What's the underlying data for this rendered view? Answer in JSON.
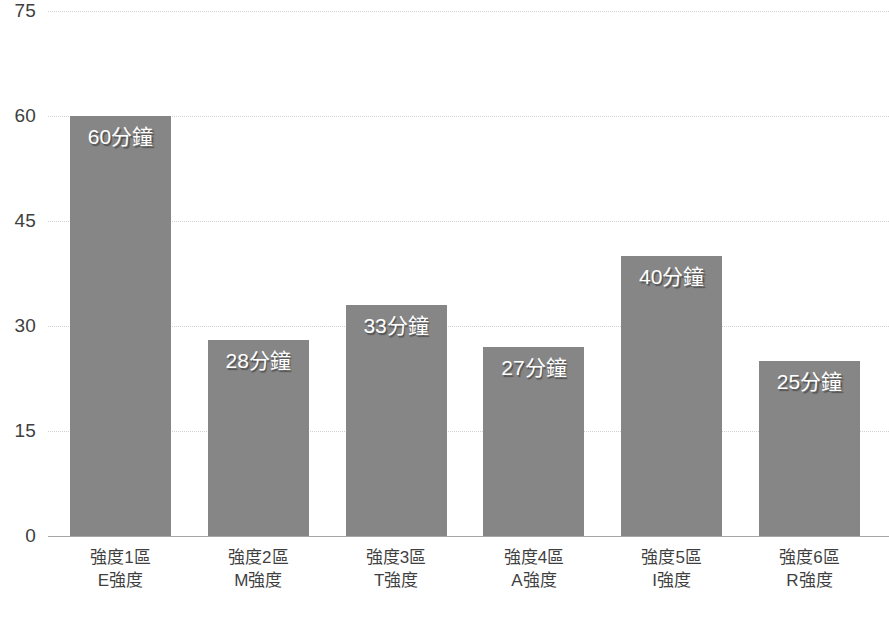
{
  "chart_data": {
    "type": "bar",
    "title": "",
    "xlabel": "",
    "ylabel": "",
    "ylim": [
      0,
      75
    ],
    "grid": true,
    "legend": "none",
    "categories": [
      "強度1區\nE強度",
      "強度2區\nM強度",
      "強度3區\nT強度",
      "強度4區\nA強度",
      "強度5區\nI強度",
      "強度6區\nR強度"
    ],
    "values": [
      60,
      28,
      33,
      27,
      40,
      25
    ],
    "data_labels": [
      "60分鐘",
      "28分鐘",
      "33分鐘",
      "27分鐘",
      "40分鐘",
      "25分鐘"
    ],
    "yticks": [
      0,
      15,
      30,
      45,
      60,
      75
    ],
    "ytick_labels": [
      "0",
      "15",
      "30",
      "45",
      "60",
      "75"
    ],
    "bar_color": "#868686",
    "gridline_color": "#d2d2d2",
    "label_text_color": "#ffffff"
  },
  "axis": {
    "ticks": [
      {
        "label": "75",
        "value": 75
      },
      {
        "label": "60",
        "value": 60
      },
      {
        "label": "45",
        "value": 45
      },
      {
        "label": "30",
        "value": 30
      },
      {
        "label": "15",
        "value": 15
      },
      {
        "label": "0",
        "value": 0
      }
    ]
  },
  "bars": [
    {
      "value": 60,
      "data_label": "60分鐘",
      "cat_line1": "強度1區",
      "cat_line2": "E強度"
    },
    {
      "value": 28,
      "data_label": "28分鐘",
      "cat_line1": "強度2區",
      "cat_line2": "M強度"
    },
    {
      "value": 33,
      "data_label": "33分鐘",
      "cat_line1": "強度3區",
      "cat_line2": "T強度"
    },
    {
      "value": 27,
      "data_label": "27分鐘",
      "cat_line1": "強度4區",
      "cat_line2": "A強度"
    },
    {
      "value": 40,
      "data_label": "40分鐘",
      "cat_line1": "強度5區",
      "cat_line2": "I強度"
    },
    {
      "value": 25,
      "data_label": "25分鐘",
      "cat_line1": "強度6區",
      "cat_line2": "R強度"
    }
  ]
}
